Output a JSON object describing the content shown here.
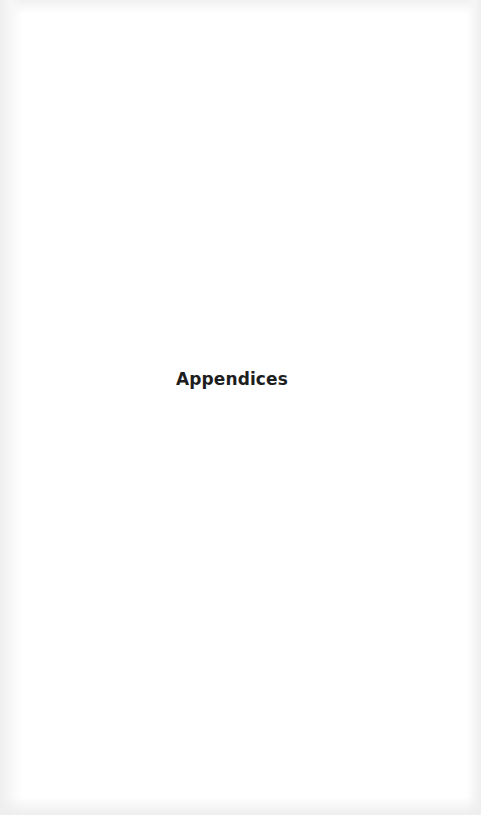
{
  "page": {
    "heading": "Appendices"
  },
  "colors": {
    "background": "#ffffff",
    "text": "#1e1e1e",
    "scan_edge": "#efefef"
  }
}
